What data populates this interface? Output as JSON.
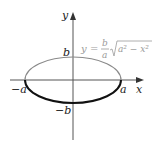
{
  "diagram": {
    "type": "ellipse-graph",
    "axes": {
      "x_label": "x",
      "y_label": "y"
    },
    "intercepts": {
      "pos_x": "a",
      "neg_x": "−a",
      "pos_y": "b",
      "neg_y": "−b"
    },
    "equation": {
      "lhs": "y",
      "eq": "=",
      "frac_num": "b",
      "frac_den": "a",
      "radicand": "a² − x²"
    },
    "colors": {
      "axis": "#555555",
      "upper_half": "#8a8a8a",
      "lower_half": "#111111",
      "equation": "#9a9a9a"
    }
  }
}
